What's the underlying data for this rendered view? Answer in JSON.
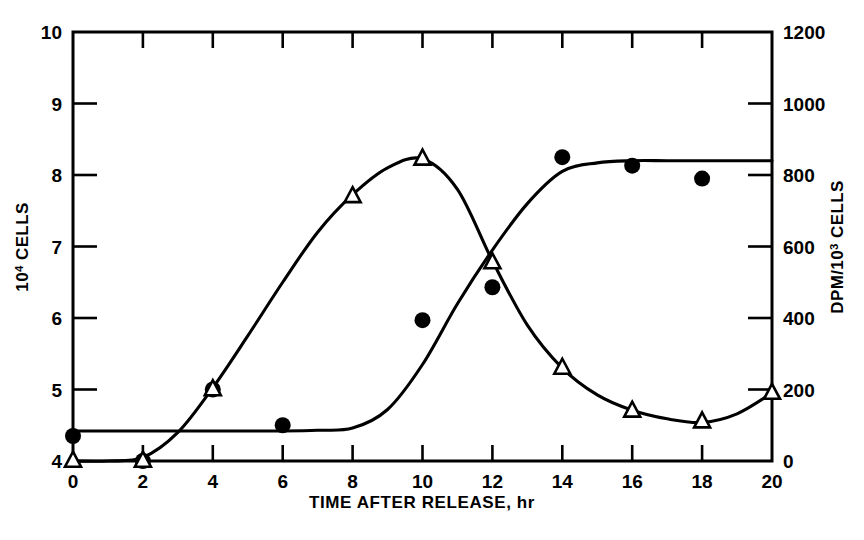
{
  "chart_data": {
    "type": "line",
    "title": "",
    "xlabel": "TIME AFTER RELEASE, hr",
    "ylabel": "10⁴ CELLS",
    "ylabel_right": "DPM/10³ CELLS",
    "xlim": [
      0,
      20
    ],
    "ylim": [
      4,
      10
    ],
    "ylim_right": [
      0,
      1200
    ],
    "grid": false,
    "legend": "none",
    "x_ticks": [
      0,
      2,
      4,
      6,
      8,
      10,
      12,
      14,
      16,
      18,
      20
    ],
    "x_tick_labels": [
      "0",
      "2",
      "4",
      "6",
      "8",
      "10",
      "12",
      "14",
      "16",
      "18",
      "20"
    ],
    "y_ticks": [
      4,
      5,
      6,
      7,
      8,
      9,
      10
    ],
    "y_tick_labels": [
      "4",
      "5",
      "6",
      "7",
      "8",
      "9",
      "10"
    ],
    "y_right_ticks": [
      0,
      200,
      400,
      600,
      800,
      1000,
      1200
    ],
    "y_right_tick_labels": [
      "0",
      "200",
      "400",
      "600",
      "800",
      "1000",
      "1200"
    ],
    "series": [
      {
        "name": "Cell number",
        "marker": "filled-circle",
        "axis": "left",
        "units": "10^4 cells",
        "x": [
          0,
          2,
          4,
          6,
          10,
          12,
          14,
          16,
          18
        ],
        "values": [
          4.35,
          4.0,
          5.0,
          4.5,
          5.97,
          6.43,
          8.25,
          8.13,
          7.95
        ],
        "curve_x": [
          0,
          1,
          2,
          3,
          4,
          5,
          6,
          7,
          8,
          9,
          10,
          11,
          12,
          13,
          14,
          15,
          16,
          17,
          18,
          19,
          20
        ],
        "curve_values": [
          4.42,
          4.42,
          4.42,
          4.42,
          4.42,
          4.42,
          4.42,
          4.43,
          4.46,
          4.72,
          5.35,
          6.2,
          6.95,
          7.6,
          8.05,
          8.17,
          8.2,
          8.2,
          8.2,
          8.2,
          8.2
        ]
      },
      {
        "name": "DPM incorporation",
        "marker": "open-triangle",
        "axis": "right",
        "units": "DPM/10^3 cells",
        "x": [
          0,
          2,
          4,
          8,
          10,
          12,
          14,
          16,
          18,
          20
        ],
        "values": [
          0,
          0,
          200,
          740,
          845,
          555,
          260,
          140,
          110,
          190
        ],
        "curve_x": [
          0,
          1,
          2,
          3,
          4,
          5,
          6,
          7,
          8,
          9,
          10,
          11,
          12,
          13,
          14,
          15,
          16,
          17,
          18,
          19,
          20
        ],
        "curve_values": [
          0,
          0,
          10,
          80,
          205,
          350,
          500,
          640,
          745,
          820,
          845,
          760,
          560,
          380,
          260,
          185,
          142,
          118,
          108,
          132,
          190
        ]
      }
    ]
  }
}
